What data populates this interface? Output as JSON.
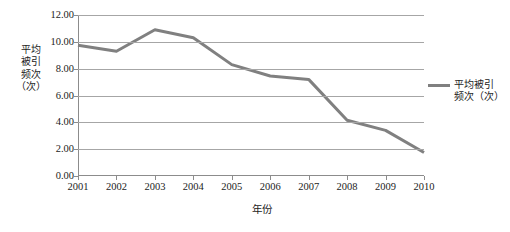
{
  "chart_data": {
    "type": "line",
    "title": "",
    "xlabel": "年份",
    "ylabel": "平均被引频次（次）",
    "ylabel_stacked": "平均\n被引\n频次\n（次）",
    "categories": [
      "2001",
      "2002",
      "2003",
      "2004",
      "2005",
      "2006",
      "2007",
      "2008",
      "2009",
      "2010"
    ],
    "x": [
      2001,
      2002,
      2003,
      2004,
      2005,
      2006,
      2007,
      2008,
      2009,
      2010
    ],
    "values": [
      9.75,
      9.3,
      10.9,
      10.3,
      8.3,
      7.45,
      7.2,
      4.15,
      3.4,
      1.75
    ],
    "series": [
      {
        "name": "平均被引频次（次）",
        "values": [
          9.75,
          9.3,
          10.9,
          10.3,
          8.3,
          7.45,
          7.2,
          4.15,
          3.4,
          1.75
        ],
        "color": "#808080"
      }
    ],
    "ylim": [
      0,
      12
    ],
    "ytick_values": [
      0,
      2,
      4,
      6,
      8,
      10,
      12
    ],
    "ytick_labels": [
      "0.00",
      "2.00",
      "4.00",
      "6.00",
      "8.00",
      "10.00",
      "12.00"
    ],
    "xlim": [
      2001,
      2010
    ],
    "grid": true,
    "grid_axis": "y",
    "legend_position": "right",
    "legend_entries": [
      "平均被引频次（次）"
    ],
    "legend_label_stacked": "平均被引\n频次（次）",
    "colors": {
      "series_line": "#808080",
      "grid": "#a6a6a6",
      "axis": "#8c8c8c",
      "text": "#1c1c1c",
      "background": "#ffffff"
    }
  }
}
